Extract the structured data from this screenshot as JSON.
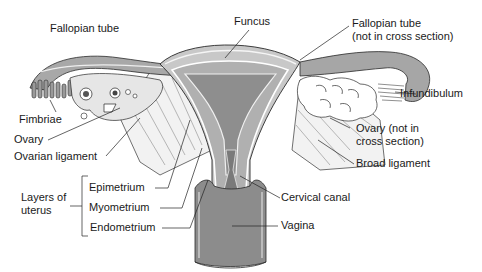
{
  "diagram": {
    "labels": {
      "fallopian_tube_left": "Fallopian tube",
      "fundus": "Funcus",
      "fallopian_tube_right": "Fallopian tube\n(not in cross section)",
      "fimbriae": "Fimbriae",
      "infundibulum": "Infundibulum",
      "ovary_left": "Ovary",
      "ovarian_ligament": "Ovarian ligament",
      "ovary_right": "Ovary (not in\ncross section)",
      "broad_ligament": "Broad ligament",
      "layers_of_uterus": "Layers of\nuterus",
      "epimetrium": "Epimetrium",
      "myometrium": "Myometrium",
      "endometrium": "Endometrium",
      "cervical_canal": "Cervical canal",
      "vagina": "Vagina"
    },
    "colors": {
      "tissue_dark": "#8a8a8a",
      "tissue_mid": "#b5b5b5",
      "tissue_light": "#d9d9d9",
      "outline": "#2a2a2a",
      "background": "#ffffff"
    }
  }
}
